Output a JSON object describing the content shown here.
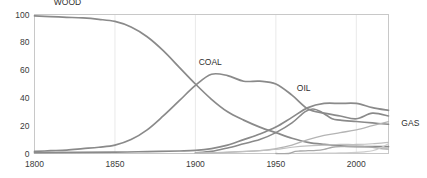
{
  "chart_data": {
    "type": "line",
    "title": "",
    "subtitle": "",
    "xlabel": "",
    "ylabel": "",
    "xlim": [
      1800,
      2020
    ],
    "ylim": [
      0,
      100
    ],
    "grid": false,
    "legend_position": "inline-labels",
    "x_ticks": [
      "1800",
      "1850",
      "1900",
      "1950",
      "2000"
    ],
    "x_tick_values": [
      1800,
      1850,
      1900,
      1950,
      2000
    ],
    "y_ticks": [
      "0",
      "20",
      "40",
      "60",
      "80",
      "100"
    ],
    "y_tick_values": [
      0,
      20,
      40,
      60,
      80,
      100
    ],
    "series": [
      {
        "name": "WOOD",
        "label": "WOOD",
        "color": "#8a8a8a",
        "width": 1.7,
        "label_x": 1812,
        "label_y": 107,
        "x": [
          1800,
          1810,
          1820,
          1830,
          1840,
          1850,
          1860,
          1870,
          1880,
          1890,
          1900,
          1910,
          1920,
          1930,
          1940,
          1950,
          1960,
          1970,
          1980,
          1990,
          2000,
          2010,
          2020
        ],
        "values": [
          99,
          98.5,
          98,
          97.5,
          96.5,
          95,
          91,
          84,
          74,
          62,
          50,
          39,
          30,
          24,
          19,
          15,
          11,
          8,
          6.5,
          5.5,
          5,
          5,
          5
        ]
      },
      {
        "name": "COAL",
        "label": "COAL",
        "color": "#8a8a8a",
        "width": 1.7,
        "label_x": 1902,
        "label_y": 64,
        "x": [
          1800,
          1810,
          1820,
          1830,
          1840,
          1850,
          1860,
          1870,
          1880,
          1890,
          1900,
          1910,
          1920,
          1930,
          1940,
          1950,
          1960,
          1970,
          1980,
          1990,
          2000,
          2010,
          2020
        ],
        "values": [
          1.5,
          2,
          2.5,
          3.5,
          4.5,
          6,
          10,
          17,
          27,
          38,
          49,
          57,
          56,
          52,
          52,
          50,
          42,
          32,
          29,
          27,
          25,
          29,
          27
        ]
      },
      {
        "name": "COAL2",
        "label": "",
        "color": "#8a8a8a",
        "width": 1.7,
        "label_x": 0,
        "label_y": 0,
        "x": [
          1800,
          1850,
          1870,
          1890,
          1900,
          1910,
          1920,
          1930,
          1940,
          1950,
          1960,
          1970,
          1980,
          1990,
          2000,
          2010,
          2020
        ],
        "values": [
          0.6,
          1.0,
          1.4,
          1.8,
          2.2,
          3.5,
          6,
          10,
          14,
          19,
          26,
          33,
          36,
          36,
          36,
          33,
          31
        ]
      },
      {
        "name": "OIL",
        "label": "OIL",
        "color": "#8a8a8a",
        "width": 1.6,
        "label_x": 1963,
        "label_y": 45,
        "x": [
          1900,
          1910,
          1920,
          1930,
          1940,
          1950,
          1960,
          1968,
          1973,
          1978,
          1985,
          1990,
          2000,
          2010,
          2020
        ],
        "values": [
          0.5,
          1.5,
          4,
          7,
          10,
          15,
          22,
          30,
          32,
          30,
          25,
          24,
          23,
          22,
          21
        ]
      },
      {
        "name": "GAS",
        "label": "GAS",
        "color": "#b4b4b4",
        "width": 1.3,
        "label_x": 2028,
        "label_y": 20,
        "x": [
          1900,
          1920,
          1940,
          1950,
          1960,
          1970,
          1980,
          1990,
          2000,
          2010,
          2020
        ],
        "values": [
          0.2,
          0.8,
          2,
          3.5,
          6,
          10,
          13,
          15,
          17,
          20,
          23
        ]
      },
      {
        "name": "HYDRO",
        "label": "",
        "color": "#c0c0c0",
        "width": 1.2,
        "label_x": 0,
        "label_y": 0,
        "x": [
          1900,
          1920,
          1940,
          1950,
          1960,
          1970,
          1980,
          1990,
          2000,
          2010,
          2020
        ],
        "values": [
          0.3,
          1,
          2,
          3,
          4.5,
          5.5,
          6,
          6.5,
          6.5,
          7,
          8
        ]
      },
      {
        "name": "NUCLEAR",
        "label": "",
        "color": "#a8a8a8",
        "width": 1.3,
        "label_x": 0,
        "label_y": 0,
        "x": [
          1950,
          1958,
          1962,
          1965,
          1970,
          1975,
          1980,
          1985,
          1990,
          2000,
          2005,
          2010,
          2015,
          2020
        ],
        "values": [
          0,
          0,
          1.5,
          1.8,
          2.0,
          2.2,
          3.0,
          4.5,
          5.0,
          5.2,
          5.0,
          4.5,
          3.5,
          3.2
        ]
      },
      {
        "name": "RENEWABLES",
        "label": "",
        "color": "#cdcdcd",
        "width": 1.2,
        "label_x": 0,
        "label_y": 0,
        "x": [
          1960,
          1980,
          1990,
          2000,
          2005,
          2010,
          2015,
          2020
        ],
        "values": [
          0,
          0.2,
          0.4,
          0.8,
          1.2,
          2.0,
          4.0,
          7.0
        ]
      }
    ]
  },
  "axis": {
    "y_tick_0": "0",
    "y_tick_1": "20",
    "y_tick_2": "40",
    "y_tick_3": "60",
    "y_tick_4": "80",
    "y_tick_5": "100",
    "x_tick_0": "1800",
    "x_tick_1": "1850",
    "x_tick_2": "1900",
    "x_tick_3": "1950",
    "x_tick_4": "2000"
  },
  "labels": {
    "wood": "WOOD",
    "coal": "COAL",
    "oil": "OIL",
    "gas": "GAS"
  },
  "colors": {
    "line": "#8a8a8a",
    "frame": "#c8c8c8",
    "text": "#3a3a3a",
    "background": "#ffffff"
  }
}
